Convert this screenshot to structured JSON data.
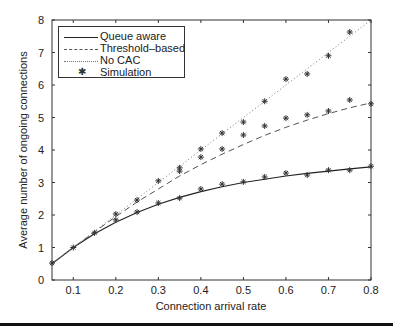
{
  "chart_data": {
    "type": "line",
    "title": "",
    "xlabel": "Connection arrival rate",
    "ylabel": "Average number of ongoing connections",
    "xlim": [
      0.05,
      0.8
    ],
    "ylim": [
      0,
      8
    ],
    "xticks": [
      "0.1",
      "0.2",
      "0.3",
      "0.4",
      "0.5",
      "0.6",
      "0.7",
      "0.8"
    ],
    "yticks": [
      "0",
      "1",
      "2",
      "3",
      "4",
      "5",
      "6",
      "7",
      "8"
    ],
    "grid": false,
    "legend_position": "upper left",
    "x": [
      0.05,
      0.1,
      0.15,
      0.2,
      0.25,
      0.3,
      0.35,
      0.4,
      0.45,
      0.5,
      0.55,
      0.6,
      0.65,
      0.7,
      0.75,
      0.8
    ],
    "series": [
      {
        "name": "Queue aware",
        "style": "solid",
        "values": [
          0.5,
          1.0,
          1.42,
          1.78,
          2.08,
          2.33,
          2.54,
          2.72,
          2.87,
          3.0,
          3.1,
          3.2,
          3.28,
          3.35,
          3.42,
          3.48
        ]
      },
      {
        "name": "Threshold-based",
        "style": "dashed",
        "values": [
          0.5,
          1.0,
          1.48,
          1.95,
          2.4,
          2.8,
          3.2,
          3.55,
          3.87,
          4.17,
          4.45,
          4.7,
          4.92,
          5.12,
          5.3,
          5.45
        ]
      },
      {
        "name": "No CAC",
        "style": "dotted",
        "values": [
          0.5,
          1.0,
          1.5,
          2.0,
          2.5,
          3.0,
          3.5,
          4.0,
          4.5,
          5.0,
          5.5,
          6.0,
          6.5,
          7.0,
          7.5,
          8.0
        ]
      },
      {
        "name": "Simulation",
        "style": "marker-star",
        "points": [
          [
            0.05,
            0.52
          ],
          [
            0.1,
            1.0
          ],
          [
            0.15,
            1.45
          ],
          [
            0.2,
            1.85
          ],
          [
            0.2,
            2.03
          ],
          [
            0.25,
            2.09
          ],
          [
            0.25,
            2.46
          ],
          [
            0.3,
            2.37
          ],
          [
            0.3,
            3.05
          ],
          [
            0.35,
            2.52
          ],
          [
            0.35,
            3.35
          ],
          [
            0.35,
            3.45
          ],
          [
            0.4,
            2.8
          ],
          [
            0.4,
            3.78
          ],
          [
            0.4,
            4.03
          ],
          [
            0.45,
            2.95
          ],
          [
            0.45,
            4.03
          ],
          [
            0.45,
            4.52
          ],
          [
            0.5,
            3.02
          ],
          [
            0.5,
            4.46
          ],
          [
            0.5,
            4.86
          ],
          [
            0.55,
            3.17
          ],
          [
            0.55,
            4.74
          ],
          [
            0.55,
            5.5
          ],
          [
            0.6,
            3.29
          ],
          [
            0.6,
            4.98
          ],
          [
            0.6,
            6.18
          ],
          [
            0.65,
            3.23
          ],
          [
            0.65,
            5.08
          ],
          [
            0.65,
            6.34
          ],
          [
            0.7,
            3.38
          ],
          [
            0.7,
            5.2
          ],
          [
            0.7,
            6.9
          ],
          [
            0.75,
            3.38
          ],
          [
            0.75,
            5.54
          ],
          [
            0.75,
            7.63
          ],
          [
            0.8,
            3.5
          ],
          [
            0.8,
            5.42
          ]
        ]
      }
    ]
  },
  "legend": {
    "items": [
      {
        "label": "Queue aware"
      },
      {
        "label": "Threshold–based"
      },
      {
        "label": "No CAC"
      },
      {
        "label": "Simulation"
      }
    ]
  },
  "axes": {
    "xlabel": "Connection arrival rate",
    "ylabel": "Average number of ongoing connections"
  },
  "colors": {
    "axis": "#333333",
    "line_solid": "#222222",
    "line_dashed": "#555555",
    "line_dotted": "#777777",
    "marker": "#333333"
  }
}
